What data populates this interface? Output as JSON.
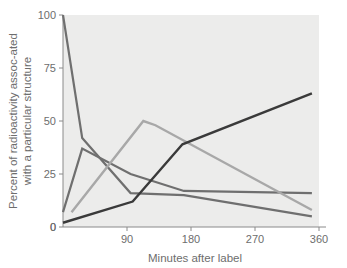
{
  "chart_data": {
    "type": "line",
    "title": "",
    "xlabel": "Minutes after label",
    "ylabel": "Percent of radioactivity associated with a particular structure",
    "ylabel_line1": "Percent of radioactivity assoc-ated",
    "ylabel_line2": "with a particular structure",
    "xlim": [
      0,
      360
    ],
    "ylim": [
      0,
      100
    ],
    "xticks": [
      0,
      90,
      180,
      270,
      360
    ],
    "xtick_labels": [
      "0",
      "90",
      "180",
      "270",
      "360"
    ],
    "yticks": [
      0,
      25,
      50,
      75,
      100
    ],
    "ytick_labels": [
      "0",
      "25",
      "50",
      "75",
      "100"
    ],
    "grid": false,
    "legend": "none",
    "plot_background": "#ececeb",
    "series": [
      {
        "name": "series-1-steep-decline",
        "color": "#6f6f6f",
        "width": 2.2,
        "x": [
          0,
          27,
          95,
          170,
          350
        ],
        "values": [
          100,
          42,
          16,
          15,
          5
        ]
      },
      {
        "name": "series-2-early-peak",
        "color": "#6f6f6f",
        "width": 2.2,
        "x": [
          0,
          27,
          95,
          170,
          350
        ],
        "values": [
          7,
          37,
          25,
          17,
          16
        ]
      },
      {
        "name": "series-3-mid-peak",
        "color": "#a8a8a8",
        "width": 2.4,
        "x": [
          12,
          113,
          130,
          350
        ],
        "values": [
          7,
          50,
          48,
          8
        ]
      },
      {
        "name": "series-4-rising",
        "color": "#3a3a3a",
        "width": 2.4,
        "x": [
          0,
          98,
          168,
          350
        ],
        "values": [
          2,
          12,
          39,
          63
        ]
      }
    ]
  }
}
